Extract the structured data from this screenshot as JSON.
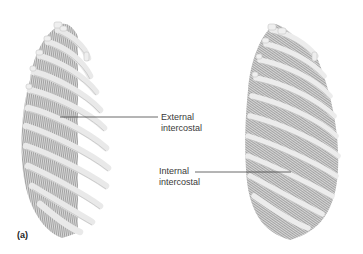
{
  "figure": {
    "panel_label": "(a)",
    "left_illustration": "rib cage with external intercostal muscles",
    "right_illustration": "rib cage with internal intercostal muscles",
    "labels": {
      "external": {
        "line1": "External",
        "line2": "intercostal"
      },
      "internal": {
        "line1": "Internal",
        "line2": "intercostal"
      }
    },
    "colors": {
      "bone": "#ececec",
      "bone_edge": "#bdbdbd",
      "muscle": "#9a9a9a",
      "leader_line": "#444444",
      "text": "#3a3a3a"
    }
  }
}
